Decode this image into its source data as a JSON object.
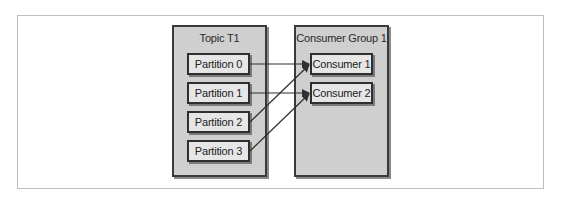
{
  "diagram": {
    "topic": {
      "title": "Topic T1",
      "partitions": [
        "Partition 0",
        "Partition 1",
        "Partition 2",
        "Partition 3"
      ]
    },
    "consumer_group": {
      "title": "Consumer Group 1",
      "consumers": [
        "Consumer 1",
        "Consumer 2"
      ]
    },
    "assignments": [
      {
        "from": "Partition 0",
        "to": "Consumer 1"
      },
      {
        "from": "Partition 1",
        "to": "Consumer 2"
      },
      {
        "from": "Partition 2",
        "to": "Consumer 1"
      },
      {
        "from": "Partition 3",
        "to": "Consumer 2"
      }
    ],
    "colors": {
      "group_fill": "#cfcfcf",
      "node_fill": "#e6e6e6",
      "stroke": "#2f2f2f"
    }
  }
}
